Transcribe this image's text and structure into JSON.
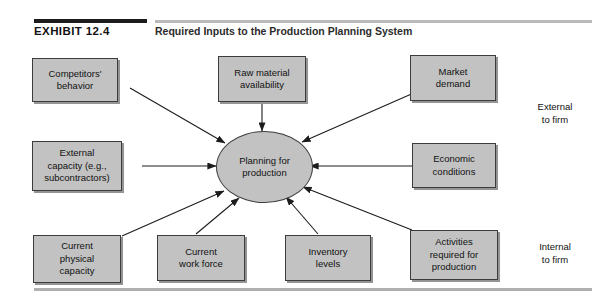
{
  "header": {
    "exhibit_label": "EXHIBIT 12.4",
    "title": "Required Inputs to the Production Planning System"
  },
  "diagram": {
    "type": "hub-and-spoke",
    "hub": {
      "id": "planning-for-production",
      "label": "Planning for\nproduction",
      "shape": "circle"
    },
    "nodes": [
      {
        "id": "competitors-behavior",
        "label": "Competitors'\nbehavior",
        "group": "external"
      },
      {
        "id": "raw-material-availability",
        "label": "Raw material\navailability",
        "group": "external"
      },
      {
        "id": "market-demand",
        "label": "Market\ndemand",
        "group": "external"
      },
      {
        "id": "external-capacity",
        "label": "External\ncapacity (e.g.,\nsubcontractors)",
        "group": "external"
      },
      {
        "id": "economic-conditions",
        "label": "Economic\nconditions",
        "group": "external"
      },
      {
        "id": "current-physical-capacity",
        "label": "Current\nphysical\ncapacity",
        "group": "internal"
      },
      {
        "id": "current-work-force",
        "label": "Current\nwork force",
        "group": "internal"
      },
      {
        "id": "inventory-levels",
        "label": "Inventory\nlevels",
        "group": "internal"
      },
      {
        "id": "activities-required",
        "label": "Activities\nrequired for\nproduction",
        "group": "internal"
      }
    ],
    "annotations": {
      "external": "External\nto firm",
      "internal": "Internal\nto firm"
    },
    "colors": {
      "node_fill": "#c2c2c2",
      "node_border": "#3c3c3c",
      "arrow": "#1c1c1c",
      "rule_dark": "#1c1c1c",
      "rule_light": "#b9b9b9",
      "page_background": "#ffffff"
    }
  }
}
